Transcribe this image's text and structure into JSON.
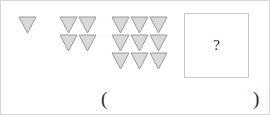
{
  "puzzle": {
    "kind": "figure-sequence-question",
    "shape_name": "down-triangle",
    "shape_fill": "#d9d9d9",
    "shape_stroke": "#9a9a9a",
    "border_color": "#d6d6d6",
    "groups": [
      {
        "index": 1,
        "rows": 1,
        "cols": 1,
        "count": 1
      },
      {
        "index": 2,
        "rows": 2,
        "cols": 2,
        "count": 4
      },
      {
        "index": 3,
        "rows": 3,
        "cols": 3,
        "count": 9
      }
    ],
    "answer_box": {
      "mark": "?",
      "border_color": "#c9c9c9"
    },
    "answer_line": {
      "open_paren": "(",
      "close_paren": ")",
      "value": ""
    }
  }
}
